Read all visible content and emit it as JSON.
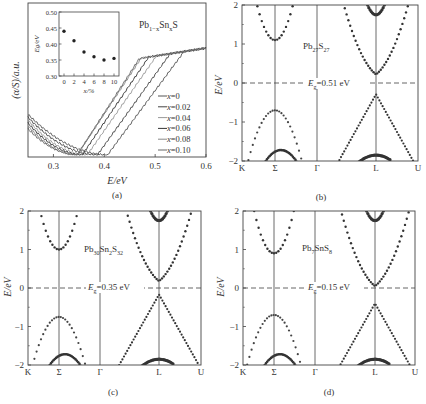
{
  "chart_data": [
    {
      "panel": "a",
      "type": "line",
      "caption": "(a)",
      "title": "Pb1-xSnxS",
      "xlabel": "E/eV",
      "ylabel": "(α/S)/a.u.",
      "xlim": [
        0.25,
        0.6
      ],
      "xticks": [
        "0.3",
        "0.4",
        "0.5",
        "0.6"
      ],
      "xtick_values": [
        0.3,
        0.4,
        0.5,
        0.6
      ],
      "grid": false,
      "legend_position": "lower right",
      "series": [
        {
          "name": "x=0",
          "color": "#555555",
          "onset": 0.41
        },
        {
          "name": "x=0.02",
          "color": "#444444",
          "onset": 0.39
        },
        {
          "name": "x=0.04",
          "color": "#999999",
          "onset": 0.37
        },
        {
          "name": "x=0.06",
          "color": "#333333",
          "onset": 0.36
        },
        {
          "name": "x=0.08",
          "color": "#888888",
          "onset": 0.35
        },
        {
          "name": "x=0.10",
          "color": "#666666",
          "onset": 0.35
        }
      ],
      "inset": {
        "type": "scatter",
        "xlabel": "x/%",
        "ylabel": "Eg/eV",
        "xlim": [
          -1,
          11
        ],
        "ylim": [
          0.3,
          0.5
        ],
        "xticks": [
          "0",
          "2",
          "4",
          "6",
          "8",
          "10"
        ],
        "yticks": [
          "0.30",
          "0.35",
          "0.40",
          "0.45",
          "0.50"
        ],
        "x": [
          0,
          2,
          4,
          6,
          8,
          10
        ],
        "y": [
          0.44,
          0.41,
          0.375,
          0.36,
          0.35,
          0.355
        ]
      }
    },
    {
      "panel": "b",
      "type": "scatter",
      "caption": "(b)",
      "title": "Pb27S27",
      "xlabel": "",
      "ylabel": "E/eV",
      "ylim": [
        -2,
        2
      ],
      "yticks": [
        "2",
        "1",
        "0",
        "−1",
        "−2"
      ],
      "kpoints": [
        "K",
        "Σ",
        "Γ",
        "L",
        "U"
      ],
      "gap_label": "Eg=0.51 eV",
      "band_gap_eV": 0.51,
      "cb_min_sigma": 1.1,
      "vb_max_sigma": -0.7,
      "cb_min_L": 0.22,
      "vb_max_L": -0.29
    },
    {
      "panel": "c",
      "type": "scatter",
      "caption": "(c)",
      "title": "Pb30Sn2S32",
      "xlabel": "",
      "ylabel": "E/eV",
      "ylim": [
        -2,
        2
      ],
      "yticks": [
        "2",
        "1",
        "0",
        "−1",
        "−2"
      ],
      "kpoints": [
        "K",
        "Σ",
        "Γ",
        "L",
        "U"
      ],
      "gap_label": "Eg=0.35 eV",
      "band_gap_eV": 0.35,
      "cb_min_sigma": 1.0,
      "vb_max_sigma": -0.75,
      "cb_min_L": 0.18,
      "vb_max_L": -0.17
    },
    {
      "panel": "d",
      "type": "scatter",
      "caption": "(d)",
      "title": "Pb7SnS8",
      "xlabel": "",
      "ylabel": "E/eV",
      "ylim": [
        -2,
        2
      ],
      "yticks": [
        "2",
        "1",
        "0",
        "−1",
        "−2"
      ],
      "kpoints": [
        "K",
        "Σ",
        "Γ",
        "L",
        "U"
      ],
      "gap_label": "Eg=0.15 eV",
      "band_gap_eV": 0.15,
      "cb_min_sigma": 0.9,
      "vb_max_sigma": -0.7,
      "cb_min_L": 0.05,
      "vb_max_L": -0.4
    }
  ],
  "labels": {
    "a": {
      "caption": "(a)",
      "ylabel": "(α/S)/a.u.",
      "xlabel": "E/eV",
      "title_main": "Pb",
      "title_sub1": "1−x",
      "title_mid": "Sn",
      "title_sub2": "x",
      "title_end": "S",
      "inset_xlabel": "x/%",
      "inset_ylabel": "Eg/eV"
    },
    "b": {
      "caption": "(b)",
      "ylabel": "E/eV",
      "gap": "=0.51 eV",
      "f1": "Pb",
      "s1": "27",
      "f2": "S",
      "s2": "27"
    },
    "c": {
      "caption": "(c)",
      "ylabel": "E/eV",
      "gap": "=0.35 eV",
      "f1": "Pb",
      "s1": "30",
      "f2": "Sn",
      "s2": "2",
      "f3": "S",
      "s3": "32"
    },
    "d": {
      "caption": "(d)",
      "ylabel": "E/eV",
      "gap": "=0.15 eV",
      "f1": "Pb",
      "s1": "7",
      "f2": "SnS",
      "s2": "8"
    }
  }
}
